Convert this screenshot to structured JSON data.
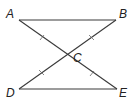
{
  "diagram": {
    "points": {
      "A": {
        "label": "A"
      },
      "B": {
        "label": "B"
      },
      "C": {
        "label": "C"
      },
      "D": {
        "label": "D"
      },
      "E": {
        "label": "E"
      }
    },
    "segments": [
      {
        "from": "A",
        "to": "B"
      },
      {
        "from": "D",
        "to": "E"
      },
      {
        "from": "A",
        "to": "E"
      },
      {
        "from": "B",
        "to": "D"
      }
    ],
    "congruence_marks": [
      {
        "segment": "AC",
        "ticks": 1
      },
      {
        "segment": "CE",
        "ticks": 1
      },
      {
        "segment": "BC",
        "ticks": 1
      },
      {
        "segment": "CD",
        "ticks": 1
      }
    ],
    "line_color": "#3a3a3a"
  }
}
